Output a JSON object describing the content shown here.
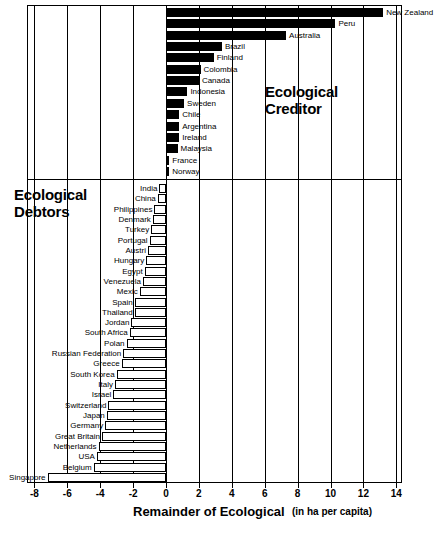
{
  "chart_data": {
    "type": "bar",
    "orientation": "horizontal",
    "title": "",
    "xlabel": "Remainder of Ecological",
    "xunits": "(in ha per capita)",
    "ylabel": "",
    "xlim": [
      -8,
      14
    ],
    "xticks": [
      -8,
      -6,
      -4,
      -2,
      0,
      2,
      4,
      6,
      8,
      10,
      12,
      14
    ],
    "xtick_labels": [
      "-8",
      "-6",
      "-4",
      "-2",
      "0",
      "2",
      "4",
      "6",
      "8",
      "10",
      "12",
      "14"
    ],
    "grid": true,
    "legend": false,
    "annotations": [
      {
        "text": "Ecological Creditor",
        "lines": [
          "Ecological",
          "Creditor"
        ]
      },
      {
        "text": "Ecological Debtors",
        "lines": [
          "Ecological",
          "Debtors"
        ]
      }
    ],
    "categories": [
      "New Zealand",
      "Peru",
      "Australia",
      "Brazil",
      "Finland",
      "Colombia",
      "Canada",
      "Indonesia",
      "Sweden",
      "Chile",
      "Argentina",
      "Ireland",
      "Malaysia",
      "France",
      "Norway",
      "India",
      "China",
      "Philippines",
      "Denmark",
      "Turkey",
      "Portugal",
      "Austri",
      "Hungary",
      "Egypt",
      "Venezuela",
      "Mexic",
      "Spain",
      "Thailand",
      "Jordan",
      "South Africa",
      "Polan",
      "Russian Federation",
      "Greece",
      "South Korea",
      "Italy",
      "Israel",
      "Switzerland",
      "Japan",
      "Germany",
      "Great Britain",
      "Netherlands",
      "USA",
      "Belgium",
      "Singapore"
    ],
    "values": [
      13.2,
      10.3,
      7.3,
      3.4,
      2.9,
      2.1,
      2.0,
      1.3,
      1.1,
      0.8,
      0.8,
      0.8,
      0.7,
      0.2,
      0.2,
      -0.4,
      -0.5,
      -0.7,
      -0.8,
      -0.9,
      -1.0,
      -1.1,
      -1.2,
      -1.3,
      -1.4,
      -1.6,
      -1.9,
      -1.9,
      -2.1,
      -2.2,
      -2.4,
      -2.6,
      -2.7,
      -3.0,
      -3.1,
      -3.2,
      -3.5,
      -3.6,
      -3.7,
      -3.9,
      -4.1,
      -4.2,
      -4.4,
      -7.2
    ],
    "groups": {
      "creditor": {
        "label": "Ecological Creditor",
        "color": "#000000",
        "count": 15
      },
      "debtors": {
        "label": "Ecological Debtors",
        "color": "#ffffff",
        "count": 29
      }
    }
  },
  "footer": {
    "fragment": ""
  }
}
